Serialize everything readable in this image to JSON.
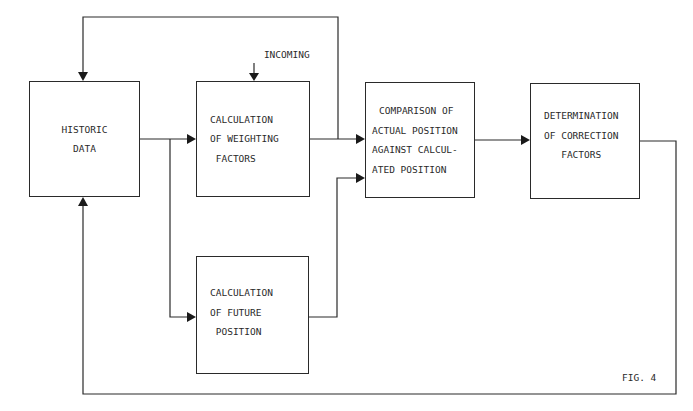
{
  "figure": {
    "caption": "FIG. 4"
  },
  "blocks": {
    "historic": {
      "lines": [
        "HISTORIC",
        "",
        "DATA"
      ]
    },
    "weighting": {
      "lines": [
        "CALCULATION",
        "OF WEIGHTING",
        " FACTORS"
      ]
    },
    "comparison": {
      "lines": [
        "COMPARISON OF",
        "ACTUAL POSITION",
        "AGAINST CALCUL-",
        "ATED POSITION"
      ]
    },
    "determination": {
      "lines": [
        "DETERMINATION",
        "OF CORRECTION",
        "   FACTORS"
      ]
    },
    "future": {
      "lines": [
        "CALCULATION",
        "OF FUTURE",
        " POSITION"
      ]
    }
  },
  "inputs": {
    "incoming": {
      "lines": [
        "INCOMING",
        "  DATA"
      ]
    }
  },
  "connections": [
    {
      "from": "historic",
      "to": "weighting"
    },
    {
      "from": "historic",
      "to": "future"
    },
    {
      "from": "weighting",
      "to": "comparison"
    },
    {
      "from": "weighting",
      "to": "historic",
      "route": "top-feedback-loop"
    },
    {
      "from": "future",
      "to": "comparison"
    },
    {
      "from": "comparison",
      "to": "determination"
    },
    {
      "from": "determination",
      "to": "historic",
      "route": "bottom-feedback-loop"
    },
    {
      "from": "incoming",
      "to": "weighting"
    }
  ]
}
